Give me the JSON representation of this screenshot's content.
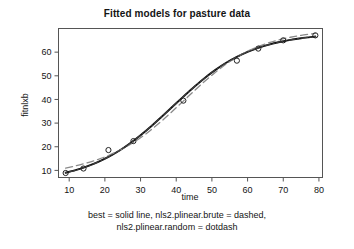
{
  "chart_data": {
    "type": "scatter",
    "title": "Fitted models for pasture data",
    "xlabel": "time",
    "ylabel": "fitnlxb",
    "xlim": [
      7,
      81
    ],
    "ylim": [
      7,
      70
    ],
    "xticks": [
      10,
      20,
      30,
      40,
      50,
      60,
      70,
      80
    ],
    "yticks": [
      10,
      20,
      30,
      40,
      50,
      60
    ],
    "grid": false,
    "legend_position": "below-figure",
    "points": {
      "name": "pasture observations",
      "marker": "open-circle",
      "x": [
        9,
        14,
        21,
        28,
        42,
        57,
        63,
        70,
        79
      ],
      "y": [
        8.9,
        10.8,
        18.6,
        22.4,
        39.5,
        56.4,
        61.5,
        65.0,
        67.1
      ]
    },
    "series": [
      {
        "name": "best",
        "style": "solid",
        "color": "#111111",
        "x": [
          9,
          12,
          15,
          18,
          21,
          24,
          27,
          30,
          33,
          36,
          39,
          42,
          45,
          48,
          51,
          54,
          57,
          60,
          63,
          66,
          69,
          72,
          75,
          79
        ],
        "y": [
          9.0,
          10.2,
          11.7,
          13.5,
          15.7,
          18.3,
          21.4,
          24.9,
          28.7,
          32.8,
          37.0,
          41.2,
          45.3,
          49.1,
          52.5,
          55.5,
          58.0,
          60.1,
          61.8,
          63.2,
          64.3,
          65.2,
          65.9,
          66.6
        ]
      },
      {
        "name": "nls2.plinear.brute",
        "style": "dashed",
        "color": "#8a8a8a",
        "x": [
          9,
          12,
          15,
          18,
          21,
          24,
          27,
          30,
          33,
          36,
          39,
          42,
          45,
          48,
          51,
          54,
          57,
          60,
          63,
          66,
          69,
          72,
          75,
          79
        ],
        "y": [
          11.0,
          12.0,
          13.2,
          14.6,
          16.3,
          18.4,
          20.9,
          23.8,
          27.2,
          31.0,
          35.1,
          39.3,
          43.6,
          47.7,
          51.5,
          55.0,
          57.9,
          60.4,
          62.4,
          64.0,
          65.3,
          66.3,
          67.1,
          67.9
        ]
      },
      {
        "name": "nls2.plinear.random",
        "style": "dotdash",
        "color": "#3d3d3d",
        "x": [
          9,
          12,
          15,
          18,
          21,
          24,
          27,
          30,
          33,
          36,
          39,
          42,
          45,
          48,
          51,
          54,
          57,
          60,
          63,
          66,
          69,
          72,
          75,
          79
        ],
        "y": [
          9.0,
          10.2,
          11.7,
          13.5,
          15.7,
          18.3,
          21.4,
          24.9,
          28.7,
          32.8,
          37.0,
          41.2,
          45.3,
          49.1,
          52.5,
          55.5,
          58.0,
          60.1,
          61.8,
          63.2,
          64.3,
          65.2,
          65.9,
          66.6
        ]
      }
    ],
    "caption_lines": [
      "best = solid line, nls2.plinear.brute = dashed,",
      "nls2.plinear.random = dotdash"
    ]
  },
  "colors": {
    "axis": "#555555",
    "solid_line": "#111111",
    "dashed_line": "#8a8a8a",
    "marker_stroke": "#222222",
    "text": "#141414",
    "background": "#ffffff"
  }
}
